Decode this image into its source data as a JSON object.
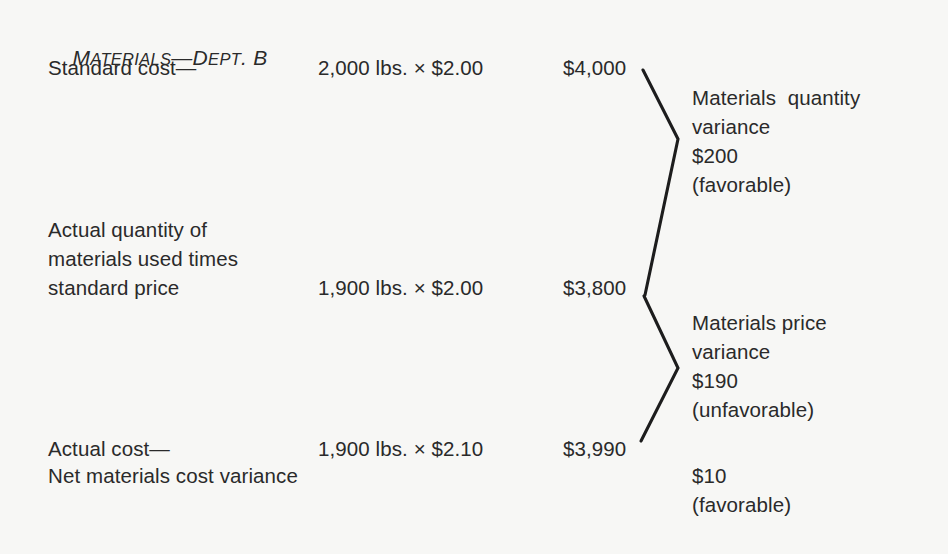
{
  "figure": {
    "title_full": "MATERIALS—DEPT. B",
    "title_parts": {
      "m": "M",
      "aterials": "ATERIALS",
      "dash": "—",
      "d": "D",
      "ept": "EPT",
      "period_b": ". B"
    },
    "background_color": "#f7f7f5",
    "text_color": "#2a2a2a",
    "rule_color": "#1d1d1d"
  },
  "rows": [
    {
      "label": "Standard cost—",
      "quantity": "2,000 lbs. × $2.00",
      "amount": "$4,000"
    },
    {
      "label_line1": "Actual quantity of",
      "label_line2": "materials used times",
      "label_line3": "standard price",
      "quantity": "1,900 lbs. × $2.00",
      "amount": "$3,800"
    },
    {
      "label": "Actual cost—",
      "quantity": "1,900 lbs. × $2.10",
      "amount": "$3,990"
    }
  ],
  "net_row": {
    "label": "Net materials cost variance"
  },
  "variances": [
    {
      "name_line1": "Materials  quantity",
      "name_line2": "variance",
      "amount": "$200",
      "direction": "(favorable)"
    },
    {
      "name_line1": "Materials price",
      "name_line2": "variance",
      "amount": "$190",
      "direction": "(unfavorable)"
    }
  ],
  "net_variance": {
    "amount": "$10",
    "direction": "(favorable)"
  }
}
